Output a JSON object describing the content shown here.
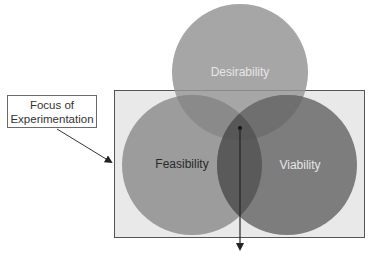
{
  "diagram": {
    "callout": {
      "line1": "Focus of",
      "line2": "Experimentation"
    },
    "circles": [
      {
        "id": "desirability",
        "label": "Desirability",
        "cx": 240,
        "cy": 72,
        "r": 68,
        "fill": "#a6a6a6",
        "text_color": "#e6e6e6"
      },
      {
        "id": "feasibility",
        "label": "Feasibility",
        "cx": 192,
        "cy": 165,
        "r": 70,
        "fill": "#9c9c9c",
        "text_color": "#2a2a2a"
      },
      {
        "id": "viability",
        "label": "Viability",
        "cx": 287,
        "cy": 165,
        "r": 70,
        "fill": "#7d7d7d",
        "text_color": "#e6e6e6"
      }
    ],
    "focus_region": {
      "x": 114,
      "y": 90,
      "width": 251,
      "height": 148,
      "fill": "#e9e9e9",
      "stroke": "#555555"
    },
    "colors": {
      "overlap_desir_feas": "#8a8a8a",
      "overlap_desir_viab": "#6f6f6f",
      "overlap_feas_viab": "#5a5a5a",
      "arrow": "#222222"
    }
  }
}
